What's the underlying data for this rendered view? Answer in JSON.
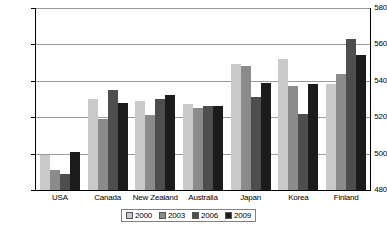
{
  "chart_data": {
    "type": "bar",
    "title": "",
    "xlabel": "",
    "ylabel": "",
    "ylim": [
      480,
      580
    ],
    "yticks": [
      480,
      500,
      520,
      540,
      560,
      580
    ],
    "grid": true,
    "legend_position": "bottom",
    "categories": [
      "USA",
      "Canada",
      "New Zealand",
      "Australia",
      "Japan",
      "Korea",
      "Finland"
    ],
    "series": [
      {
        "name": "2000",
        "color": "#c9c9c9",
        "values": [
          499,
          530,
          529,
          527,
          549,
          552,
          538
        ]
      },
      {
        "name": "2003",
        "color": "#8b8b8b",
        "values": [
          491,
          519,
          521,
          525,
          548,
          537,
          544
        ]
      },
      {
        "name": "2006",
        "color": "#4e4e4e",
        "values": [
          489,
          535,
          530,
          526,
          531,
          522,
          563
        ]
      },
      {
        "name": "2009",
        "color": "#1c1c1c",
        "values": [
          501,
          528,
          532,
          526,
          539,
          538,
          554
        ]
      }
    ]
  },
  "axis": {
    "y_tick_labels": [
      "580",
      "560",
      "540",
      "520",
      "500",
      "480"
    ]
  },
  "legend": {
    "items": [
      {
        "label": "2000"
      },
      {
        "label": "2003"
      },
      {
        "label": "2006"
      },
      {
        "label": "2009"
      }
    ]
  }
}
